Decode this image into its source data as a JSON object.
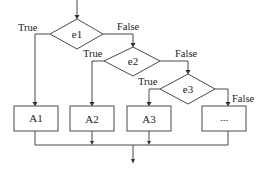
{
  "diagram": {
    "type": "flowchart",
    "decisions": [
      {
        "id": "e1",
        "label": "e1",
        "true_label": "True",
        "false_label": "False"
      },
      {
        "id": "e2",
        "label": "e2",
        "true_label": "True",
        "false_label": "False"
      },
      {
        "id": "e3",
        "label": "e3",
        "true_label": "True",
        "false_label": "False"
      }
    ],
    "actions": [
      {
        "id": "A1",
        "label": "A1"
      },
      {
        "id": "A2",
        "label": "A2"
      },
      {
        "id": "A3",
        "label": "A3"
      },
      {
        "id": "more",
        "label": "..."
      }
    ],
    "colors": {
      "stroke": "#4a4a4a",
      "background": "#ffffff",
      "text": "#222222"
    }
  }
}
